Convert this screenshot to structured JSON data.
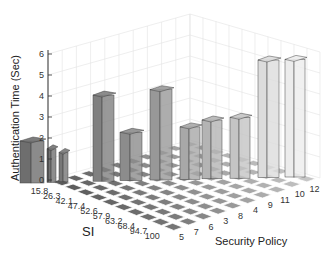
{
  "chart_data": {
    "type": "bar3d",
    "title": "",
    "ylabel": "Authentication Time (Sec)",
    "xlabel": "Security Policy",
    "zlabel": "SI",
    "ylim": [
      0,
      6
    ],
    "y_ticks": [
      "0",
      "1",
      "2",
      "3",
      "4",
      "5",
      "6"
    ],
    "si_ticks": [
      "15.8",
      "26.3",
      "42.1",
      "47.4",
      "52.6",
      "57.9",
      "63.2",
      "68.4",
      "94.7",
      "100"
    ],
    "policy_ticks": [
      "5",
      "7",
      "6",
      "3",
      "8",
      "4",
      "9",
      "11",
      "10",
      "12"
    ],
    "grid": true,
    "bars": [
      {
        "si": "15.8",
        "policy": "5",
        "value": 2.0,
        "x": 20,
        "w": 24,
        "shade": "#6e6e6e"
      },
      {
        "si": "26.3",
        "policy": "7",
        "value": 1.6,
        "x": 47,
        "w": 9,
        "shade": "#727272"
      },
      {
        "si": "42.1",
        "policy": "6",
        "value": 1.4,
        "x": 59,
        "w": 9,
        "shade": "#777777"
      },
      {
        "si": "47.4",
        "policy": "3",
        "value": 4.1,
        "x": 93,
        "w": 21,
        "shade": "#808080"
      },
      {
        "si": "52.6",
        "policy": "8",
        "value": 2.3,
        "x": 120,
        "w": 22,
        "shade": "#8c8c8c"
      },
      {
        "si": "57.9",
        "policy": "4",
        "value": 4.3,
        "x": 150,
        "w": 22,
        "shade": "#989898"
      },
      {
        "si": "63.2",
        "policy": "9",
        "value": 2.5,
        "x": 180,
        "w": 20,
        "shade": "#a8a8a8"
      },
      {
        "si": "68.4",
        "policy": "11",
        "value": 2.8,
        "x": 202,
        "w": 20,
        "shade": "#b4b4b4"
      },
      {
        "si": "94.7",
        "policy": "10",
        "value": 2.9,
        "x": 230,
        "w": 20,
        "shade": "#c4c4c4"
      },
      {
        "si": "100",
        "policy": "12",
        "value": 5.6,
        "x": 258,
        "w": 21,
        "shade": "#dcdcdc"
      },
      {
        "si": "100",
        "policy": "12",
        "value": 5.6,
        "x": 285,
        "w": 20,
        "shade": "#ececec"
      }
    ]
  }
}
